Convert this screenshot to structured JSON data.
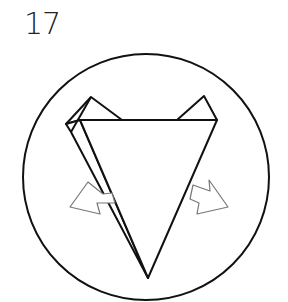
{
  "step": {
    "number": "17"
  },
  "diagram": {
    "stroke_color": "#111111",
    "arrow_fill": "#ffffff",
    "arrow_stroke": "#777777",
    "icons": [
      "left-arrow-icon",
      "right-arrow-icon"
    ]
  }
}
